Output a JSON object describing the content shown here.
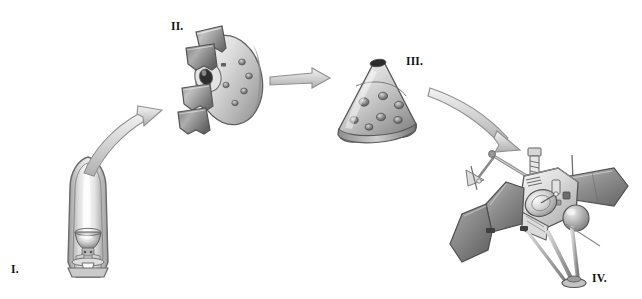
{
  "figure": {
    "background_color": "#ffffff",
    "ink_color": "#111111",
    "width": 642,
    "height": 299,
    "style": "grayscale airbrush technical illustration"
  },
  "stages": [
    {
      "id": "stage-1",
      "label": "I.",
      "name": "launch-fairing",
      "description": "Spacecraft stowed inside rocket nose-cone fairing with folded dish antenna visible in cutaway",
      "label_x": 11,
      "label_y": 263
    },
    {
      "id": "stage-2",
      "label": "II.",
      "name": "shroud-separation",
      "description": "Disc-shaped cruise stage with four petal shroud panels separating outward",
      "label_x": 171,
      "label_y": 20
    },
    {
      "id": "stage-3",
      "label": "III.",
      "name": "aeroshell-cone",
      "description": "Conical aeroshell entry capsule with circular thruster ports and dark apex opening",
      "label_x": 406,
      "label_y": 55
    },
    {
      "id": "stage-4",
      "label": "IV.",
      "name": "deployed-spacecraft",
      "description": "Fully deployed orbiter with solar panel wings, high-gain dish antenna, magnetometer boom, instrument mast, propellant tank and landing legs",
      "label_x": 592,
      "label_y": 272
    }
  ],
  "arrows": [
    {
      "id": "arrow-1",
      "name": "arrow-stage1-to-stage2",
      "shape": "curved-up",
      "from": "stage-1",
      "to": "stage-2"
    },
    {
      "id": "arrow-2",
      "name": "arrow-stage2-to-stage3",
      "shape": "straight-horizontal",
      "from": "stage-2",
      "to": "stage-3"
    },
    {
      "id": "arrow-3",
      "name": "arrow-stage3-to-stage4",
      "shape": "curved-down",
      "from": "stage-3",
      "to": "stage-4"
    }
  ],
  "palette": {
    "outline": "#4d4d4d",
    "outline_dark": "#2b2b2b",
    "metal_light": "#f2f2f2",
    "metal_mid": "#c9c9c9",
    "metal_dark": "#8c8c8c",
    "metal_deep": "#5e5e5e",
    "shadow": "#3a3a3a",
    "arrow_fill": "#dcdcdc",
    "arrow_edge": "#8f8f8f"
  }
}
